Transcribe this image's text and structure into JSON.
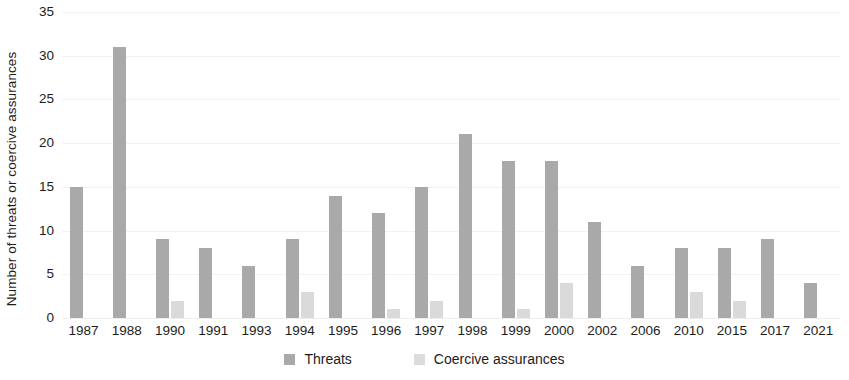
{
  "chart_data": {
    "type": "bar",
    "title": "",
    "xlabel": "",
    "ylabel": "Number of threats or coercive assurances",
    "ylim": [
      0,
      35
    ],
    "ytick_step": 5,
    "yticks": [
      35,
      30,
      25,
      20,
      15,
      10,
      5,
      0
    ],
    "grid": true,
    "legend_position": "bottom",
    "categories": [
      "1987",
      "1988",
      "1990",
      "1991",
      "1993",
      "1994",
      "1995",
      "1996",
      "1997",
      "1998",
      "1999",
      "2000",
      "2002",
      "2006",
      "2010",
      "2015",
      "2017",
      "2021"
    ],
    "series": [
      {
        "name": "Threats",
        "color": "#a9a9a9",
        "values": [
          15,
          31,
          9,
          8,
          6,
          9,
          14,
          12,
          15,
          21,
          18,
          18,
          11,
          6,
          8,
          8,
          9,
          4
        ]
      },
      {
        "name": "Coercive assurances",
        "color": "#dadada",
        "values": [
          0,
          0,
          2,
          0,
          0,
          3,
          0,
          1,
          2,
          0,
          1,
          4,
          0,
          0,
          3,
          2,
          0,
          0
        ]
      }
    ]
  },
  "legend": {
    "items": [
      {
        "label": "Threats",
        "swatch": "threats"
      },
      {
        "label": "Coercive assurances",
        "swatch": "assurances"
      }
    ]
  }
}
